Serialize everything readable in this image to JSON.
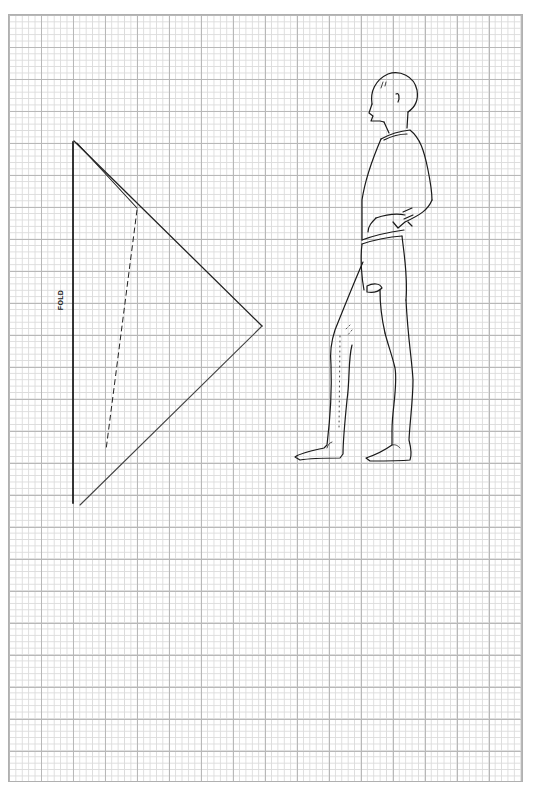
{
  "sheet": {
    "type": "pattern-draft-graph-paper",
    "grid": {
      "minor_cell_px": 6.4,
      "major_every": 5,
      "minor_color": "#dcdcdc",
      "major_color": "#b8b8b8"
    }
  },
  "pattern_piece": {
    "shape": "triangle",
    "fold_label": "FOLD",
    "line_color": "#222222",
    "lines": {
      "fold_edge": "solid vertical",
      "outer_edges": "solid diagonal",
      "inner_seam": "solid diagonal then dashed"
    }
  }
}
